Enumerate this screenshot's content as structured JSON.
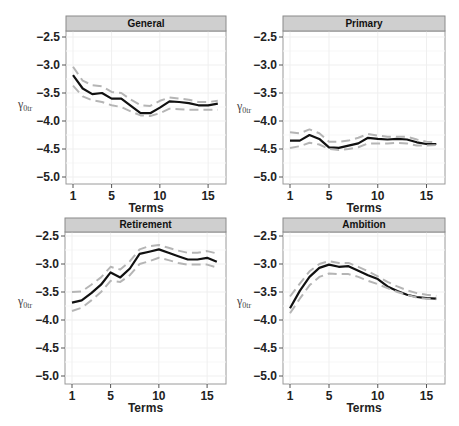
{
  "figure": {
    "x_axis_title": "Terms",
    "y_axis_label": "γ",
    "y_axis_subscript": "0tr",
    "colors": {
      "mean_line": "#111111",
      "ci_line": "#b5b5b5",
      "strip_bg": "#cfcfcf",
      "strip_border": "#8a8a8a",
      "panel_border": "#9a9a9a",
      "grid": "#efefef"
    }
  },
  "chart_data": [
    {
      "type": "line",
      "title": "General",
      "xlabel": "Terms",
      "ylabel": "γ0tr",
      "x": [
        1,
        2,
        3,
        4,
        5,
        6,
        7,
        8,
        9,
        10,
        11,
        12,
        13,
        14,
        15,
        16
      ],
      "xticks": [
        1,
        5,
        10,
        15
      ],
      "yticks": [
        -2.5,
        -3.0,
        -3.5,
        -4.0,
        -4.5,
        -5.0
      ],
      "ylim": [
        -5.1,
        -2.3
      ],
      "grid": true,
      "series": [
        {
          "name": "mean",
          "style": "solid",
          "values": [
            -3.18,
            -3.42,
            -3.52,
            -3.5,
            -3.6,
            -3.6,
            -3.73,
            -3.86,
            -3.86,
            -3.76,
            -3.65,
            -3.66,
            -3.68,
            -3.72,
            -3.72,
            -3.69
          ]
        },
        {
          "name": "upper",
          "style": "dashed",
          "values": [
            -3.03,
            -3.28,
            -3.36,
            -3.38,
            -3.48,
            -3.5,
            -3.62,
            -3.72,
            -3.73,
            -3.64,
            -3.58,
            -3.6,
            -3.62,
            -3.66,
            -3.66,
            -3.64
          ]
        },
        {
          "name": "lower",
          "style": "dashed",
          "values": [
            -3.37,
            -3.56,
            -3.63,
            -3.66,
            -3.72,
            -3.75,
            -3.83,
            -3.9,
            -3.91,
            -3.86,
            -3.78,
            -3.79,
            -3.8,
            -3.8,
            -3.8,
            -3.8
          ]
        }
      ]
    },
    {
      "type": "line",
      "title": "Primary",
      "xlabel": "Terms",
      "ylabel": "γ0tr",
      "x": [
        1,
        2,
        3,
        4,
        5,
        6,
        7,
        8,
        9,
        10,
        11,
        12,
        13,
        14,
        15,
        16
      ],
      "xticks": [
        1,
        5,
        10,
        15
      ],
      "yticks": [
        -2.5,
        -3.0,
        -3.5,
        -4.0,
        -4.5,
        -5.0
      ],
      "ylim": [
        -5.1,
        -2.3
      ],
      "grid": true,
      "series": [
        {
          "name": "mean",
          "style": "solid",
          "values": [
            -4.35,
            -4.35,
            -4.25,
            -4.32,
            -4.47,
            -4.48,
            -4.44,
            -4.4,
            -4.3,
            -4.32,
            -4.33,
            -4.32,
            -4.33,
            -4.38,
            -4.41,
            -4.41
          ]
        },
        {
          "name": "upper",
          "style": "dashed",
          "values": [
            -4.2,
            -4.22,
            -4.15,
            -4.22,
            -4.37,
            -4.37,
            -4.35,
            -4.3,
            -4.23,
            -4.26,
            -4.28,
            -4.28,
            -4.28,
            -4.33,
            -4.37,
            -4.38
          ]
        },
        {
          "name": "lower",
          "style": "dashed",
          "values": [
            -4.48,
            -4.45,
            -4.39,
            -4.42,
            -4.5,
            -4.52,
            -4.5,
            -4.47,
            -4.4,
            -4.4,
            -4.4,
            -4.39,
            -4.4,
            -4.44,
            -4.44,
            -4.43
          ]
        }
      ]
    },
    {
      "type": "line",
      "title": "Retirement",
      "xlabel": "Terms",
      "ylabel": "γ0tr",
      "x": [
        1,
        2,
        3,
        4,
        5,
        6,
        7,
        8,
        9,
        10,
        11,
        12,
        13,
        14,
        15,
        16
      ],
      "xticks": [
        1,
        5,
        10,
        15
      ],
      "yticks": [
        -2.5,
        -3.0,
        -3.5,
        -4.0,
        -4.5,
        -5.0
      ],
      "ylim": [
        -5.1,
        -2.3
      ],
      "grid": true,
      "series": [
        {
          "name": "mean",
          "style": "solid",
          "values": [
            -3.69,
            -3.65,
            -3.52,
            -3.37,
            -3.15,
            -3.24,
            -3.08,
            -2.82,
            -2.78,
            -2.74,
            -2.8,
            -2.86,
            -2.92,
            -2.92,
            -2.89,
            -2.96
          ]
        },
        {
          "name": "upper",
          "style": "dashed",
          "values": [
            -3.5,
            -3.49,
            -3.37,
            -3.24,
            -3.05,
            -3.1,
            -2.95,
            -2.74,
            -2.68,
            -2.66,
            -2.71,
            -2.76,
            -2.8,
            -2.8,
            -2.77,
            -2.81
          ]
        },
        {
          "name": "lower",
          "style": "dashed",
          "values": [
            -3.84,
            -3.78,
            -3.65,
            -3.5,
            -3.3,
            -3.32,
            -3.2,
            -3.0,
            -2.95,
            -2.89,
            -2.93,
            -2.98,
            -3.01,
            -3.01,
            -3.01,
            -3.06
          ]
        }
      ]
    },
    {
      "type": "line",
      "title": "Ambition",
      "xlabel": "Terms",
      "ylabel": "γ0tr",
      "x": [
        1,
        2,
        3,
        4,
        5,
        6,
        7,
        8,
        9,
        10,
        11,
        12,
        13,
        14,
        15,
        16
      ],
      "xticks": [
        1,
        5,
        10,
        15
      ],
      "yticks": [
        -2.5,
        -3.0,
        -3.5,
        -4.0,
        -4.5,
        -5.0
      ],
      "ylim": [
        -5.1,
        -2.3
      ],
      "grid": true,
      "series": [
        {
          "name": "mean",
          "style": "solid",
          "values": [
            -3.79,
            -3.48,
            -3.23,
            -3.07,
            -3.01,
            -3.05,
            -3.04,
            -3.12,
            -3.2,
            -3.27,
            -3.4,
            -3.48,
            -3.55,
            -3.59,
            -3.61,
            -3.62
          ]
        },
        {
          "name": "upper",
          "style": "dashed",
          "values": [
            -3.58,
            -3.35,
            -3.13,
            -3.0,
            -2.95,
            -2.98,
            -2.98,
            -3.05,
            -3.13,
            -3.22,
            -3.32,
            -3.4,
            -3.47,
            -3.52,
            -3.55,
            -3.57
          ]
        },
        {
          "name": "lower",
          "style": "dashed",
          "values": [
            -3.88,
            -3.62,
            -3.38,
            -3.23,
            -3.17,
            -3.18,
            -3.18,
            -3.23,
            -3.3,
            -3.36,
            -3.43,
            -3.5,
            -3.55,
            -3.6,
            -3.62,
            -3.63
          ]
        }
      ]
    }
  ],
  "panels_layout": [
    {
      "left": 66,
      "right": 226,
      "strip_top": 16,
      "strip_bottom": 31,
      "plot_bottom": 184,
      "y_top_tick": 37,
      "y_step": 28,
      "x1": 73,
      "x_per_term": 9.65,
      "ylab_x": 18,
      "ylab_y": 108
    },
    {
      "left": 283,
      "right": 445,
      "strip_top": 16,
      "strip_bottom": 31,
      "plot_bottom": 184,
      "y_top_tick": 37,
      "y_step": 28,
      "x1": 290,
      "x_per_term": 9.75,
      "ylab_x": 237,
      "ylab_y": 110
    },
    {
      "left": 65,
      "right": 226,
      "strip_top": 218,
      "strip_bottom": 232,
      "plot_bottom": 384,
      "y_top_tick": 236,
      "y_step": 28,
      "x1": 72,
      "x_per_term": 9.65,
      "ylab_x": 18,
      "ylab_y": 305
    },
    {
      "left": 283,
      "right": 445,
      "strip_top": 218,
      "strip_bottom": 232,
      "plot_bottom": 384,
      "y_top_tick": 236,
      "y_step": 28,
      "x1": 290,
      "x_per_term": 9.75,
      "ylab_x": 237,
      "ylab_y": 305
    }
  ]
}
